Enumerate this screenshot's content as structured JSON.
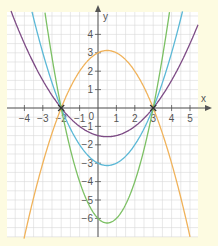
{
  "chart_data": {
    "type": "line",
    "title": "",
    "xlabel": "x",
    "ylabel": "y",
    "xlim": [
      -5,
      5.4
    ],
    "ylim": [
      -7,
      5.2
    ],
    "grid": true,
    "grid_step": 0.5,
    "x_ticks": [
      -4,
      -3,
      -2,
      -1,
      1,
      2,
      3,
      4,
      5
    ],
    "y_ticks": [
      -6,
      -5,
      -4,
      -3,
      -2,
      -1,
      1,
      2,
      3,
      4
    ],
    "origin_label": "0",
    "roots": [
      -2,
      3
    ],
    "series": [
      {
        "name": "orange parabola",
        "color": "#f0b25a",
        "formula": "y = -0.5(x+2)(x-3)",
        "a": -0.5,
        "vertex": [
          0.5,
          3.125
        ]
      },
      {
        "name": "purple parabola",
        "color": "#7d4b85",
        "formula": "y = 0.25(x+2)(x-3)",
        "a": 0.25,
        "vertex": [
          0.5,
          -1.5625
        ]
      },
      {
        "name": "blue parabola",
        "color": "#5bb8d6",
        "formula": "y = 0.5(x+2)(x-3)",
        "a": 0.5,
        "vertex": [
          0.5,
          -3.125
        ]
      },
      {
        "name": "green parabola",
        "color": "#7cc064",
        "formula": "y = (x+2)(x-3)",
        "a": 1,
        "vertex": [
          0.5,
          -6.25
        ]
      }
    ],
    "root_markers": [
      {
        "x": -2,
        "y": 0,
        "label": "×"
      },
      {
        "x": 3,
        "y": 0,
        "label": "×"
      }
    ]
  },
  "colors": {
    "background": "#fdfbe1",
    "plot_background": "#ffffff",
    "grid": "#d9d9d9",
    "axis": "#555555"
  }
}
